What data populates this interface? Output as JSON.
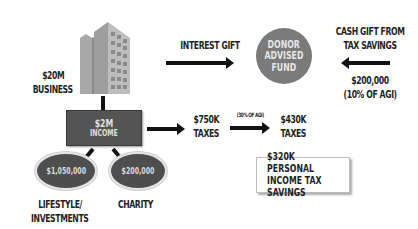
{
  "diagram": {
    "business": {
      "amount": "$20M",
      "label": "BUSINESS"
    },
    "interest_gift": {
      "label": "INTEREST GIFT"
    },
    "donor_fund": {
      "line1": "DONOR",
      "line2": "ADVISED",
      "line3": "FUND"
    },
    "cash_gift": {
      "line1": "CASH GIFT FROM",
      "line2": "TAX SAVINGS",
      "amount": "$200,000",
      "note": "(10% OF AGI)"
    },
    "income": {
      "amount": "$2M",
      "label": "INCOME"
    },
    "lifestyle": {
      "amount": "$1,050,000",
      "label_line1": "LIFESTYLE/",
      "label_line2": "INVESTMENTS"
    },
    "charity": {
      "amount": "$200,000",
      "label": "CHARITY"
    },
    "taxes_before": {
      "amount": "$750K",
      "label": "TAXES"
    },
    "agi_note": "(30% OF AGI)",
    "taxes_after": {
      "amount": "$430K",
      "label": "TAXES"
    },
    "savings": {
      "line1": "$320K PERSONAL",
      "line2": "INCOME TAX SAVINGS"
    }
  },
  "colors": {
    "building": "#9a9a9a",
    "donor_circle": "#7a7a7a",
    "income_box": "#545454",
    "ellipse": "#4e4e4e",
    "text": "#1e1e1e"
  }
}
